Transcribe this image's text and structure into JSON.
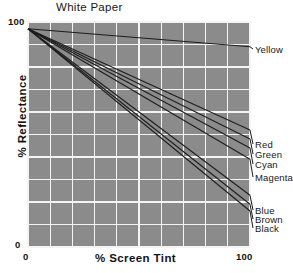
{
  "chart_data": {
    "type": "line",
    "title": "White Paper",
    "xlabel": "% Screen Tint",
    "ylabel": "% Reflectance",
    "xlim": [
      0,
      100
    ],
    "ylim": [
      0,
      100
    ],
    "xticks": [
      "0",
      "100"
    ],
    "yticks": [
      "0",
      "100"
    ],
    "grid": true,
    "grid_divisions_x": 10,
    "grid_divisions_y": 10,
    "legend_position": "right-inline-labels",
    "x": [
      0,
      100
    ],
    "series": [
      {
        "name": "Yellow",
        "values": [
          97,
          89
        ],
        "label_y": 45
      },
      {
        "name": "Red",
        "values": [
          97,
          52
        ],
        "label_y": 140
      },
      {
        "name": "Green",
        "values": [
          97,
          48
        ],
        "label_y": 150
      },
      {
        "name": "Cyan",
        "values": [
          97,
          44
        ],
        "label_y": 160
      },
      {
        "name": "Magenta",
        "values": [
          97,
          39
        ],
        "label_y": 173
      },
      {
        "name": "Blue",
        "values": [
          97,
          23
        ],
        "label_y": 206
      },
      {
        "name": "Brown",
        "values": [
          97,
          19
        ],
        "label_y": 215
      },
      {
        "name": "Black",
        "values": [
          97,
          16
        ],
        "label_y": 224
      }
    ]
  },
  "axis": {
    "y_top": "100",
    "y_bottom": "0",
    "x_left": "0",
    "x_right": "100"
  },
  "colors": {
    "plot_background": "#8b8b8b",
    "gridline": "#f2f2f2",
    "line": "#1c1c1c",
    "page_background": "#ffffff",
    "text": "#161616"
  }
}
